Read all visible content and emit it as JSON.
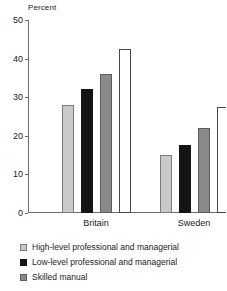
{
  "chart_data": {
    "type": "bar",
    "title": "",
    "subtitle": "",
    "xlabel": "",
    "ylabel": "Percent",
    "ylim": [
      0,
      50
    ],
    "yticks": [
      0,
      10,
      20,
      30,
      40,
      50
    ],
    "ytick_labels": [
      "0",
      "10",
      "20",
      "30",
      "40",
      "50"
    ],
    "grid": false,
    "legend_position": "below",
    "categories": [
      "Britain",
      "Sweden"
    ],
    "series": [
      {
        "name": "High-level professional and managerial",
        "key": "high",
        "color": "#c9c9c9",
        "values": [
          28,
          15
        ]
      },
      {
        "name": "Low-level professional and managerial",
        "key": "low",
        "color": "#141414",
        "values": [
          32,
          17.5
        ]
      },
      {
        "name": "Skilled manual",
        "key": "skilled",
        "color": "#8a8a8a",
        "values": [
          36,
          22
        ]
      },
      {
        "name": "",
        "key": "unskilled",
        "color": "#ffffff",
        "values": [
          42.5,
          27.5
        ]
      }
    ]
  },
  "axis": {
    "y_title": "Percent"
  },
  "legend": {
    "items": [
      {
        "label": "High-level professional and managerial",
        "swatch": "legend-swatch-high"
      },
      {
        "label": "Low-level professional and managerial",
        "swatch": "legend-swatch-low"
      },
      {
        "label": "Skilled manual",
        "swatch": "legend-swatch-skilled"
      }
    ]
  }
}
